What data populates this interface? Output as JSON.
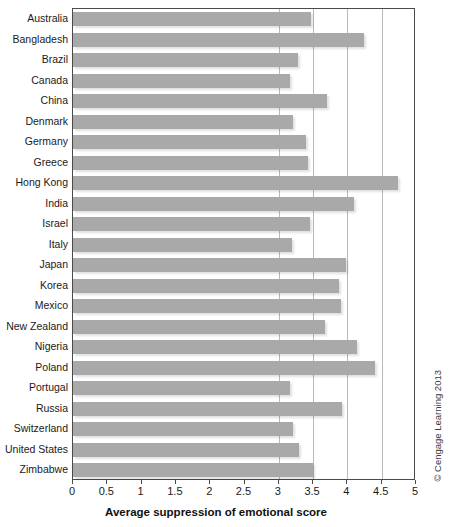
{
  "chart_data": {
    "type": "bar",
    "orientation": "horizontal",
    "title": "",
    "subtitle": "",
    "xlabel": "Average suppression of emotional score",
    "ylabel": "",
    "xlim": [
      0,
      5
    ],
    "xticks": [
      0,
      0.5,
      1,
      1.5,
      2,
      2.5,
      3,
      3.5,
      4,
      4.5,
      5
    ],
    "xtick_labels": [
      "0",
      "0.5",
      "1",
      "1.5",
      "2",
      "2.5",
      "3",
      "3.5",
      "4",
      "4.5",
      "5"
    ],
    "gridlines": {
      "x": [
        3,
        3.5,
        4,
        4.5
      ],
      "y": []
    },
    "grid": true,
    "legend": null,
    "legend_position": "none",
    "bar_color": "#a9a9a9",
    "categories": [
      "Australia",
      "Bangladesh",
      "Brazil",
      "Canada",
      "China",
      "Denmark",
      "Germany",
      "Greece",
      "Hong Kong",
      "India",
      "Israel",
      "Italy",
      "Japan",
      "Korea",
      "Mexico",
      "New Zealand",
      "Nigeria",
      "Poland",
      "Portugal",
      "Russia",
      "Switzerland",
      "United States",
      "Zimbabwe"
    ],
    "values": [
      3.47,
      4.24,
      3.28,
      3.16,
      3.7,
      3.2,
      3.4,
      3.43,
      4.74,
      4.1,
      3.45,
      3.19,
      3.98,
      3.88,
      3.9,
      3.68,
      4.14,
      4.4,
      3.17,
      3.92,
      3.21,
      3.3,
      3.5
    ]
  },
  "credit": {
    "text": "© Cengage Learning 2013"
  },
  "axis": {
    "x_title": "Average suppression of emotional score"
  }
}
